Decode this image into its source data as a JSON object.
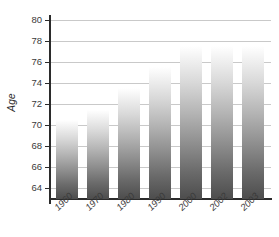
{
  "chart_data": {
    "type": "bar",
    "title": "",
    "subtitle": "",
    "xlabel": "",
    "ylabel": "Age",
    "categories": [
      "1960",
      "1970",
      "1980",
      "1990",
      "2000",
      "2002",
      "2003"
    ],
    "values": [
      70.5,
      71.5,
      73.5,
      75.5,
      77.5,
      77.5,
      77.5
    ],
    "series": [
      {
        "name": "Age",
        "values": [
          70.5,
          71.5,
          73.5,
          75.5,
          77.5,
          77.5,
          77.5
        ]
      }
    ],
    "ylim": [
      63.0,
      80.0
    ],
    "yticks": [
      64,
      66,
      68,
      70,
      72,
      74,
      76,
      78,
      80
    ],
    "ytick_labels": [
      "64",
      "66",
      "68",
      "70",
      "72",
      "74",
      "76",
      "78",
      "80"
    ],
    "grid": true,
    "grid_axis": "y",
    "legend": false,
    "legend_position": "none",
    "bar_fill": "vertical-gradient-white-to-dark-gray",
    "colors": {
      "bar_top": "#ffffff",
      "bar_bottom": "#4d4d4d",
      "gridline": "#c9c9c9",
      "axis": "#2b2b2b",
      "text": "#3a3a3a",
      "background": "#ffffff"
    }
  }
}
